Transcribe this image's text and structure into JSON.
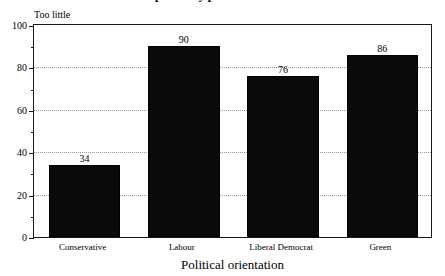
{
  "figure": {
    "clipped_title": "Responses by political orientation",
    "panel_label": "Too little",
    "background": "#ffffff",
    "bar_color": "#0a0a0a",
    "grid_color": "#9a9a9a",
    "axis_color": "#1a1a1a"
  },
  "chart_data": {
    "type": "bar",
    "title": "Responses by political orientation",
    "subtitle": "Too little",
    "categories": [
      "Conservative",
      "Labour",
      "Liberal Democrat",
      "Green"
    ],
    "values": [
      34,
      90,
      76,
      86
    ],
    "data_labels": [
      "34",
      "90",
      "76",
      "86"
    ],
    "xlabel": "Political orientation",
    "ylabel": "",
    "ylim": [
      0,
      100
    ],
    "ytick_labels": [
      "0",
      "20",
      "40",
      "60",
      "80",
      "100"
    ],
    "ytick_values": [
      0,
      20,
      40,
      60,
      80,
      100
    ],
    "yminor_values": [
      10,
      30,
      50,
      70,
      90
    ],
    "grid": true,
    "grid_axis": "y",
    "legend": "none",
    "orientation": "vertical"
  }
}
